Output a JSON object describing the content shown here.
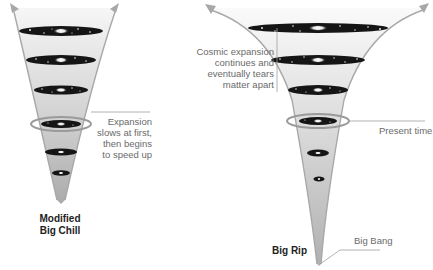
{
  "diagram": {
    "colors": {
      "cone_gradient_top": "#f4f4f4",
      "cone_gradient_bottom": "#b5b5b5",
      "arrow": "#a8a8a8",
      "disc": "#151515",
      "ring": "#9a9a9a",
      "leader_line": "#a0a0a0",
      "label_text": "#6a6a6a",
      "title_text": "#222222"
    },
    "scenarios": [
      {
        "id": "modified-big-chill",
        "title_line1": "Modified",
        "title_line2": "Big Chill",
        "annotation": [
          "Expansion",
          "slows at first,",
          "then begins",
          "to speed up"
        ]
      },
      {
        "id": "big-rip",
        "title": "Big Rip",
        "annotation_top": [
          "Cosmic expansion",
          "continues and",
          "eventually tears",
          "matter apart"
        ],
        "annotation_present": "Present time",
        "annotation_origin": "Big Bang"
      }
    ]
  }
}
